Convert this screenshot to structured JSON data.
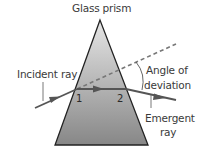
{
  "diagram": {
    "title": "Glass prism",
    "labels": {
      "incident_ray": "Incident ray",
      "angle_line1": "Angle of",
      "angle_line2": "deviation",
      "emergent_line1": "Emergent",
      "emergent_line2": "ray",
      "point1": "1",
      "point2": "2"
    },
    "colors": {
      "prism_top": "#e6e6e6",
      "prism_bottom": "#878787",
      "outline": "#222222",
      "ray": "#555555",
      "dashed": "#777777",
      "text": "#3a3a3a"
    }
  }
}
